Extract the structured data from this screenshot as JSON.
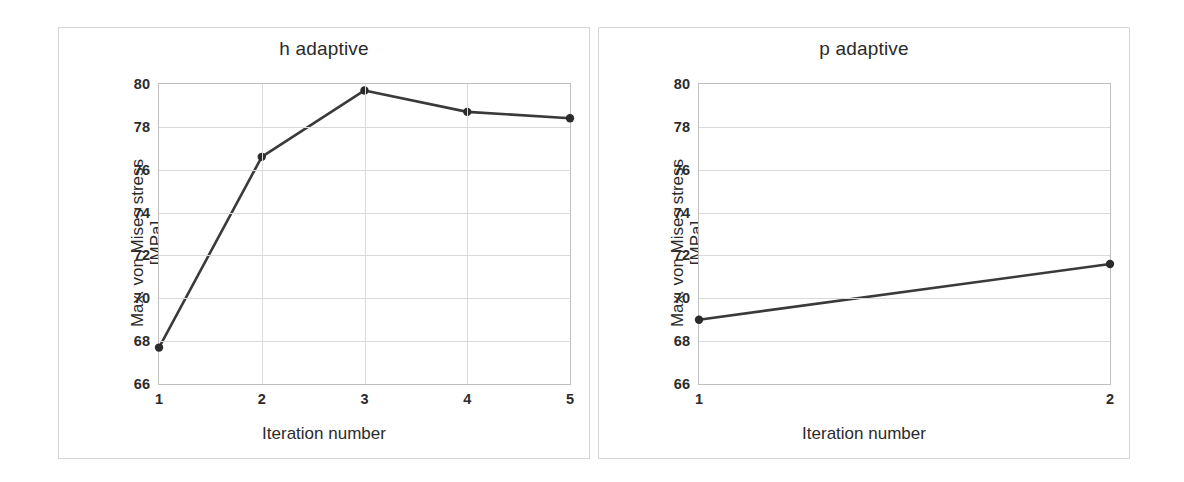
{
  "chart_data": [
    {
      "type": "line",
      "title": "h adaptive",
      "xlabel": "Iteration number",
      "ylabel_line1": "Max. von Mises stress",
      "ylabel_line2": "[MPa]",
      "categories": [
        "1",
        "2",
        "3",
        "4",
        "5"
      ],
      "x": [
        1,
        2,
        3,
        4,
        5
      ],
      "values": [
        67.7,
        76.6,
        79.7,
        78.7,
        78.4
      ],
      "xlim": [
        1,
        5
      ],
      "ylim": [
        66,
        80
      ],
      "yticks": [
        66,
        68,
        70,
        72,
        74,
        76,
        78,
        80
      ],
      "xticks": [
        1,
        2,
        3,
        4,
        5
      ],
      "grid": "horizontal-and-vertical",
      "legend": "none",
      "line_color": "#3a3a3a",
      "marker_color": "#2b2b2b",
      "marker": "circle"
    },
    {
      "type": "line",
      "title": "p adaptive",
      "xlabel": "Iteration number",
      "ylabel_line1": "Max. von Mises stress",
      "ylabel_line2": "[MPa]",
      "categories": [
        "1",
        "2"
      ],
      "x": [
        1,
        2
      ],
      "values": [
        69.0,
        71.6
      ],
      "xlim": [
        1,
        2
      ],
      "ylim": [
        66,
        80
      ],
      "yticks": [
        66,
        68,
        70,
        72,
        74,
        76,
        78,
        80
      ],
      "xticks": [
        1,
        2
      ],
      "grid": "horizontal-and-vertical",
      "legend": "none",
      "line_color": "#3a3a3a",
      "marker_color": "#2b2b2b",
      "marker": "circle"
    }
  ],
  "colors": {
    "background": "#ffffff",
    "panel_border": "#d6d6d6",
    "plot_border": "#bfbfbf",
    "gridline": "#d9d9d9",
    "line": "#3a3a3a",
    "text": "#2b2b2b"
  }
}
